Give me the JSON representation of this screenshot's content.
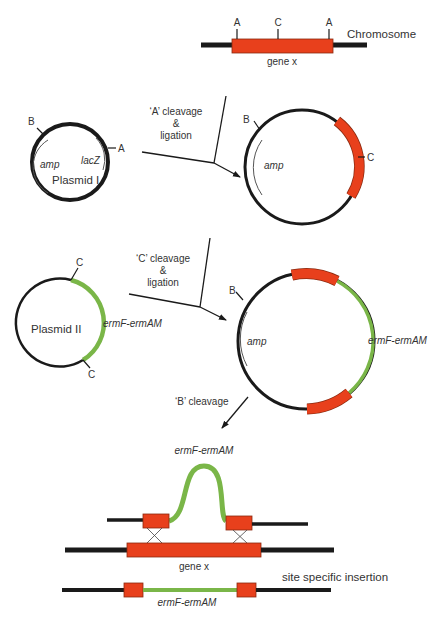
{
  "colors": {
    "dna": "#1a1a1a",
    "gene": "#e8401c",
    "gene_outline": "#8a2a10",
    "insert": "#7ab648",
    "text": "#333333"
  },
  "chromosome": {
    "label": "Chromosome",
    "gene_label": "gene x",
    "sites": [
      "A",
      "C",
      "A"
    ]
  },
  "step1": {
    "label_line1": "‘A’ cleavage",
    "label_line2": "&",
    "label_line3": "ligation"
  },
  "plasmid1": {
    "name": "Plasmid I",
    "amp_label": "amp",
    "lacz_label": "lacZ",
    "site_b": "B",
    "site_a": "A"
  },
  "recombinant1": {
    "site_b": "B",
    "site_c": "C",
    "amp_label": "amp"
  },
  "step2": {
    "label_line1": "‘C’ cleavage",
    "label_line2": "&",
    "label_line3": "ligation"
  },
  "plasmid2": {
    "name": "Plasmid II",
    "insert_label": "ermF-ermAM",
    "site_c_top": "C",
    "site_c_bottom": "C"
  },
  "recombinant2": {
    "site_b": "B",
    "amp_label": "amp",
    "insert_label": "ermF-ermAM"
  },
  "step3": {
    "label": "‘B’ cleavage"
  },
  "crossover": {
    "insert_label": "ermF-ermAM",
    "gene_label": "gene x"
  },
  "result": {
    "title": "site specific insertion",
    "insert_label": "ermF-ermAM"
  }
}
